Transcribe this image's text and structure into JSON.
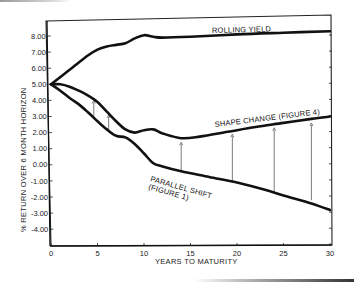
{
  "chart_data": {
    "type": "line",
    "title": "",
    "xlabel": "YEARS TO MATURITY",
    "ylabel": "% RETURN OVER 6 MONTH HORIZON",
    "xlim": [
      0,
      30
    ],
    "ylim": [
      -5,
      9
    ],
    "x_ticks": [
      0,
      5,
      10,
      15,
      20,
      25,
      30
    ],
    "x_tick_labels": [
      "0",
      "5",
      "10",
      "15",
      "20",
      "25",
      "30"
    ],
    "y_ticks": [
      8,
      7,
      6,
      5,
      4,
      3,
      2,
      1,
      0,
      -1,
      -2,
      -3,
      -4
    ],
    "y_tick_labels": [
      "8.00",
      "7.00",
      "6.00",
      "5.00",
      "4.00",
      "3.00",
      "2.00",
      "1.00",
      "0.00",
      "-1.00",
      "-2.00",
      "-3.00",
      "-4.00"
    ],
    "grid": false,
    "legend": "inline labels",
    "series": [
      {
        "name": "ROLLING YIELD",
        "x": [
          0,
          2,
          4,
          5,
          6,
          7,
          8,
          9,
          10,
          11,
          12,
          15,
          20,
          25,
          30
        ],
        "values": [
          5.0,
          5.9,
          6.8,
          7.15,
          7.35,
          7.45,
          7.55,
          7.85,
          8.05,
          7.95,
          7.9,
          7.95,
          8.1,
          8.2,
          8.3
        ]
      },
      {
        "name": "SHAPE CHANGE (FIGURE 4)",
        "x": [
          0,
          1,
          2,
          3,
          4,
          5,
          6,
          7,
          8,
          9,
          10,
          11,
          12,
          14,
          16,
          19,
          22,
          25,
          28,
          30
        ],
        "values": [
          5.0,
          5.0,
          4.85,
          4.6,
          4.3,
          3.9,
          3.3,
          2.7,
          2.2,
          2.0,
          2.15,
          2.2,
          1.95,
          1.65,
          1.75,
          2.05,
          2.35,
          2.6,
          2.85,
          3.0
        ]
      },
      {
        "name": "PARALLEL SHIFT (FIGURE 1)",
        "x": [
          0,
          1,
          2,
          3,
          4,
          5,
          6,
          7,
          8,
          9,
          10,
          11,
          12,
          14,
          17,
          20,
          23,
          25,
          28,
          30
        ],
        "values": [
          5.0,
          4.6,
          4.15,
          3.75,
          3.25,
          2.7,
          2.2,
          1.8,
          1.7,
          1.3,
          0.7,
          0.1,
          -0.1,
          -0.4,
          -0.75,
          -1.1,
          -1.55,
          -1.9,
          -2.4,
          -2.8
        ]
      }
    ],
    "annotations": [
      {
        "type": "arrow",
        "x": 4.6,
        "from": 3.0,
        "to": 4.0
      },
      {
        "type": "arrow",
        "x": 6.2,
        "from": 2.1,
        "to": 3.1
      },
      {
        "type": "arrow",
        "x": 14.0,
        "from": -0.4,
        "to": 1.4
      },
      {
        "type": "arrow",
        "x": 19.5,
        "from": -1.0,
        "to": 1.9
      },
      {
        "type": "arrow",
        "x": 24.0,
        "from": -1.75,
        "to": 2.3
      },
      {
        "type": "arrow",
        "x": 28.0,
        "from": -2.2,
        "to": 2.6
      }
    ]
  },
  "labels": {
    "rolling_yield": "ROLLING YIELD",
    "shape_change": "SHAPE CHANGE (FIGURE 4)",
    "parallel_shift_line1": "PARALLEL SHIFT",
    "parallel_shift_line2": "(FIGURE 1)",
    "xlabel": "YEARS TO MATURITY",
    "ylabel": "% RETURN OVER 6 MONTH HORIZON"
  }
}
